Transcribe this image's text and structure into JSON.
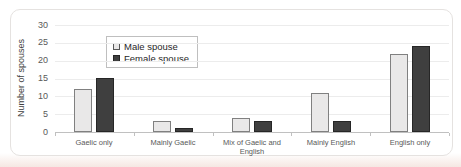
{
  "chart_data": {
    "type": "bar",
    "title": "",
    "categories": [
      "Gaelic only",
      "Mainly Gaelic",
      "Mix of Gaelic and English",
      "Mainly English",
      "English only"
    ],
    "series": [
      {
        "name": "Male spouse",
        "values": [
          12,
          3,
          4,
          11,
          22
        ]
      },
      {
        "name": "Female spouse",
        "values": [
          15,
          1,
          3,
          3,
          24
        ]
      }
    ],
    "xlabel": "",
    "ylabel": "Number of spouses",
    "ylim": [
      0,
      30
    ],
    "yticks": [
      0,
      5,
      10,
      15,
      20,
      25,
      30
    ],
    "grid": true,
    "legend_position": "top-left-inside",
    "colors": {
      "male_fill": "#e9e8e8",
      "male_border": "#808080",
      "female_fill": "#3f3f3f",
      "female_border": "#262626",
      "gridline": "#ececec",
      "axis_line": "#c0c0c0",
      "tick_text": "#595959",
      "category_text": "#595959",
      "card_border": "#e5e2e0"
    }
  }
}
